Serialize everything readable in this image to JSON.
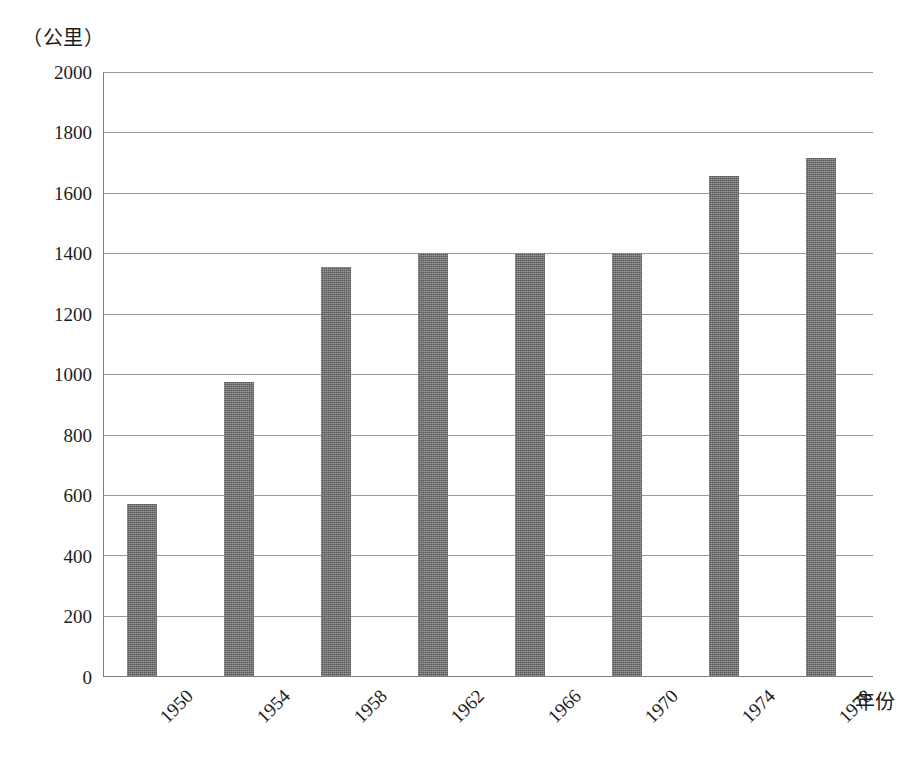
{
  "chart_data": {
    "type": "bar",
    "title": "",
    "subtitle": "",
    "xlabel": "年份",
    "ylabel": "（公里）",
    "categories": [
      "1950",
      "1954",
      "1958",
      "1962",
      "1966",
      "1970",
      "1974",
      "1978"
    ],
    "values": [
      570,
      975,
      1355,
      1400,
      1400,
      1400,
      1655,
      1715
    ],
    "series": [
      {
        "name": "",
        "values": [
          570,
          975,
          1355,
          1400,
          1400,
          1400,
          1655,
          1715
        ]
      }
    ],
    "ylim": [
      0,
      2000
    ],
    "ytick_labels": [
      "2000",
      "1800",
      "1600",
      "1400",
      "1200",
      "1000",
      "800",
      "600",
      "400",
      "200",
      "0"
    ],
    "ytick_values": [
      2000,
      1800,
      1600,
      1400,
      1200,
      1000,
      800,
      600,
      400,
      200,
      0
    ],
    "ytick_step": 200,
    "grid": true,
    "grid_axis": "y",
    "legend": false,
    "legend_position": "none",
    "annotations": [],
    "bar_color": "#6e6e6e",
    "grid_color": "#9a9a9a",
    "axis_color": "#7d7d7d",
    "background_color": "#ffffff",
    "xtick_rotation": 45
  },
  "axes": {
    "y_unit_caption": "（公里）",
    "x_axis_title": "年份"
  }
}
